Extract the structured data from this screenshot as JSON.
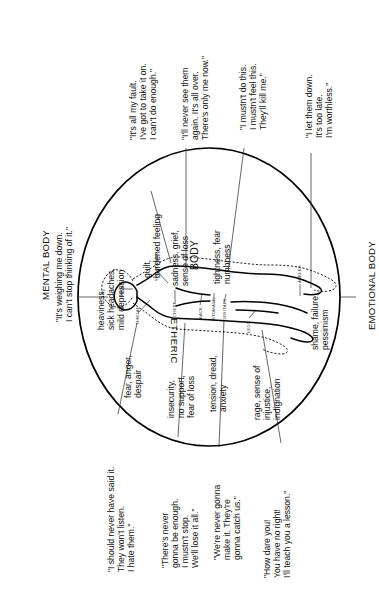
{
  "diagram": {
    "title_left": "MENTAL BODY",
    "title_left_quote": "\"It's weighing me down.\nI can't stop thinking of it.\"",
    "title_right": "EMOTIONAL BODY",
    "center_label": "BODY",
    "etheric_label": "ETHERIC",
    "body_parts": [
      {
        "name": "HEAD"
      },
      {
        "name": "THROAT"
      },
      {
        "name": "SHOULDERS"
      },
      {
        "name": "CHEST"
      },
      {
        "name": "BACK"
      },
      {
        "name": "STOMACH"
      },
      {
        "name": "GENITALS"
      },
      {
        "name": "LEGS"
      },
      {
        "name": "ANKLES"
      }
    ],
    "sensations": [
      {
        "id": "head",
        "text": "heaviness,\nsick headaches,\nmild depression"
      },
      {
        "id": "shoulders",
        "text": "guilt,\nburdened feeling"
      },
      {
        "id": "chest",
        "text": "sadness, grief,\nsense of loss"
      },
      {
        "id": "stomach",
        "text": "tightness, fear\nnumbness"
      },
      {
        "id": "ankles",
        "text": "shame, failure,\npessimism"
      },
      {
        "id": "throat",
        "text": "fear, anger,\ndespair"
      },
      {
        "id": "back",
        "text": "insecurity,\nno support,\nfear of loss"
      },
      {
        "id": "genitals",
        "text": "tension, dread,\nanxiety"
      },
      {
        "id": "legs",
        "text": "rage, sense of\ninjustice,\nindignation"
      }
    ],
    "mental_quotes": [
      {
        "id": "q-shoulders",
        "text": "\"It's all my fault.\nI've got to take it on.\nI can't do enough.\""
      },
      {
        "id": "q-chest",
        "text": "\"I'll never see them\nagain. It's all over.\nThere's only me now.\""
      },
      {
        "id": "q-stomach",
        "text": "\"I mustn't do this.\nI mustn't feel this.\nThey'll kill me.\""
      },
      {
        "id": "q-ankles",
        "text": "\"I let them down.\nIt's too late.\nI'm worthless.\""
      }
    ],
    "emotional_quotes": [
      {
        "id": "q-throat",
        "text": "\"I should never have said it.\nThey won't listen.\nI hate them.\""
      },
      {
        "id": "q-back",
        "text": "\"There's never\ngonna be enough.\nI mustn't stop.\nWe'll lose it all.\""
      },
      {
        "id": "q-genitals",
        "text": "\"We're never gonna\nmake it. They're\ngonna catch us.\""
      },
      {
        "id": "q-legs",
        "text": "\"How dare you!\nYou have no right!\nI'll teach you a lesson.\""
      }
    ],
    "colors": {
      "ink": "#000000",
      "line": "#333333",
      "background": "#ffffff"
    }
  }
}
